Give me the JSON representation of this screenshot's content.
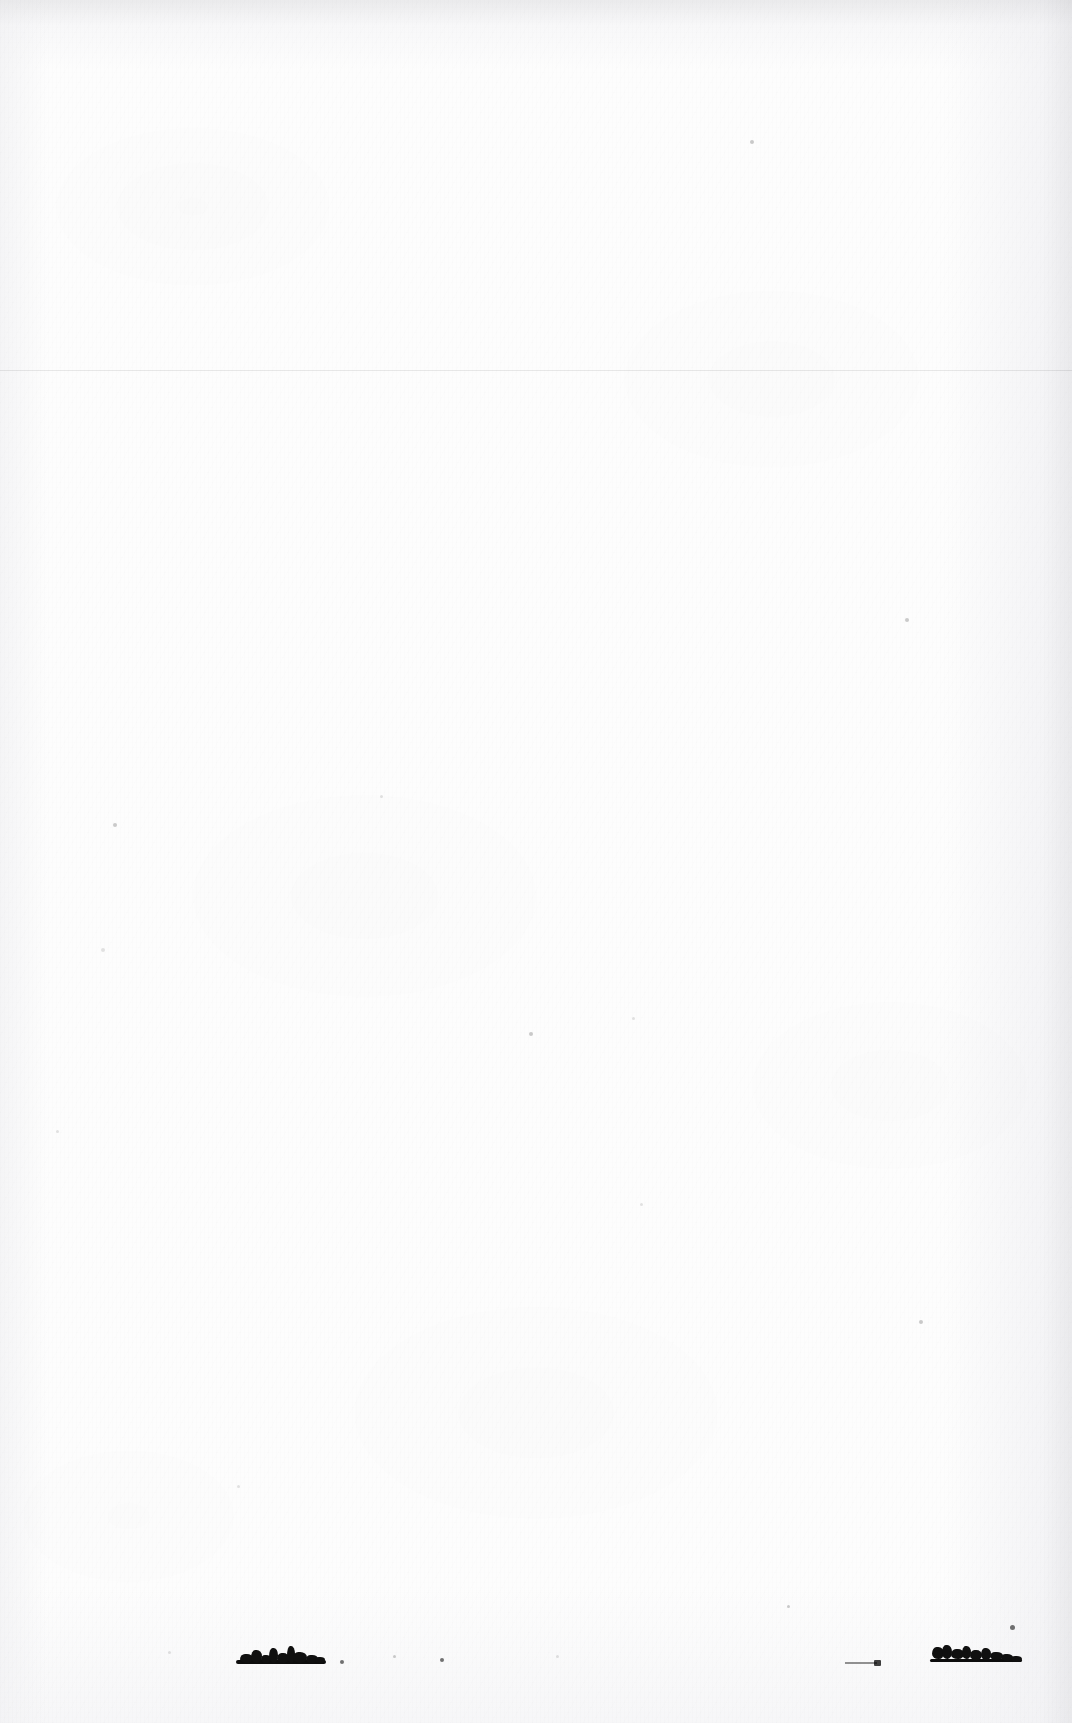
{
  "document": {
    "kind": "scanned-page",
    "description": "Blank scanned document page",
    "page_width": 1072,
    "page_height": 1723,
    "paper_color": "#fdfdfd",
    "ink_color": "#101010",
    "text_content": "",
    "visible_text": []
  },
  "features": {
    "faint_rule": {
      "name": "faint-horizontal-rule",
      "x": 0,
      "y": 370,
      "width": 1072,
      "height": 1,
      "color": "#000000",
      "opacity": "0.085"
    },
    "smudges": [
      {
        "name": "ink-smudge-left",
        "label": "illegible ink mark",
        "x": 236,
        "y": 1646,
        "width": 90,
        "height": 18
      },
      {
        "name": "ink-smudge-right",
        "label": "illegible ink mark",
        "x": 930,
        "y": 1643,
        "width": 92,
        "height": 19
      }
    ],
    "dashes": [
      {
        "name": "faint-dash",
        "label": "worn text remnant",
        "x": 845,
        "y": 1662,
        "width": 32
      }
    ],
    "specks": [
      {
        "x": 750,
        "y": 140,
        "size": 4,
        "tone": "faint"
      },
      {
        "x": 905,
        "y": 618,
        "size": 4,
        "tone": "faint"
      },
      {
        "x": 113,
        "y": 823,
        "size": 4,
        "tone": "faint"
      },
      {
        "x": 101,
        "y": 948,
        "size": 4,
        "tone": "vfaint"
      },
      {
        "x": 380,
        "y": 795,
        "size": 3,
        "tone": "vfaint"
      },
      {
        "x": 529,
        "y": 1032,
        "size": 4,
        "tone": "faint"
      },
      {
        "x": 632,
        "y": 1017,
        "size": 3,
        "tone": "vfaint"
      },
      {
        "x": 919,
        "y": 1320,
        "size": 4,
        "tone": "faint"
      },
      {
        "x": 1010,
        "y": 1625,
        "size": 5,
        "tone": "normal"
      },
      {
        "x": 787,
        "y": 1605,
        "size": 3,
        "tone": "faint"
      },
      {
        "x": 340,
        "y": 1660,
        "size": 4,
        "tone": "normal"
      },
      {
        "x": 393,
        "y": 1655,
        "size": 3,
        "tone": "faint"
      },
      {
        "x": 440,
        "y": 1658,
        "size": 4,
        "tone": "normal"
      },
      {
        "x": 556,
        "y": 1655,
        "size": 3,
        "tone": "vfaint"
      },
      {
        "x": 168,
        "y": 1651,
        "size": 3,
        "tone": "vfaint"
      },
      {
        "x": 237,
        "y": 1485,
        "size": 3,
        "tone": "vfaint"
      },
      {
        "x": 640,
        "y": 1203,
        "size": 3,
        "tone": "vfaint"
      },
      {
        "x": 56,
        "y": 1130,
        "size": 3,
        "tone": "vfaint"
      }
    ]
  }
}
